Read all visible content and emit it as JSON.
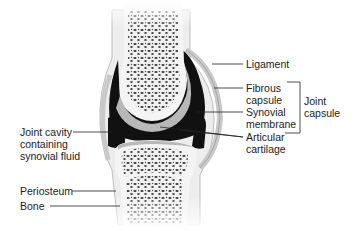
{
  "diagram": {
    "labels_right": [
      {
        "id": "ligament",
        "text": "Ligament"
      },
      {
        "id": "fibrous-capsule",
        "text": "Fibrous\ncapsule"
      },
      {
        "id": "synovial-membrane",
        "text": "Synovial\nmembrane"
      },
      {
        "id": "articular-cartilage",
        "text": "Articular\ncartilage"
      }
    ],
    "bracket_label": {
      "id": "joint-capsule",
      "text": "Joint\ncapsule"
    },
    "labels_left": [
      {
        "id": "joint-cavity",
        "text": "Joint cavity\ncontaining\nsynovial fluid"
      },
      {
        "id": "periosteum",
        "text": "Periosteum"
      },
      {
        "id": "bone",
        "text": "Bone"
      }
    ],
    "colors": {
      "bone": "#f4f4f4",
      "spongy": "#3a3a3a",
      "cavity": "#111111",
      "cartilage": "#b5b5b5",
      "capsule": "#d6d6d6",
      "line": "#222222"
    }
  }
}
